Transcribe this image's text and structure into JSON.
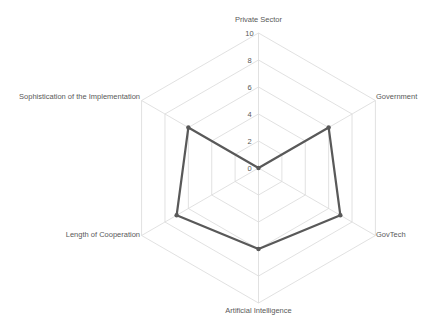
{
  "chart_data": {
    "type": "radar",
    "title": "",
    "categories": [
      "Private Sector",
      "Government",
      "GovTech",
      "Artificial Intelligence",
      "Length of Cooperation",
      "Sophistication of the Implementation"
    ],
    "series": [
      {
        "name": "Series 1",
        "values": [
          0,
          6,
          7,
          6,
          7,
          6
        ],
        "color": "#595959"
      }
    ],
    "radial_ticks": [
      "0",
      "2",
      "4",
      "6",
      "8",
      "10"
    ],
    "rlim": [
      0,
      10
    ],
    "grid": true,
    "legend": "none"
  },
  "colors": {
    "grid": "#d9d9d9",
    "text": "#595959",
    "series": "#595959"
  }
}
